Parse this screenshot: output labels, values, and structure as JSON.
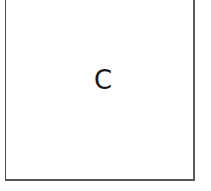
{
  "card": {
    "label": "C"
  }
}
